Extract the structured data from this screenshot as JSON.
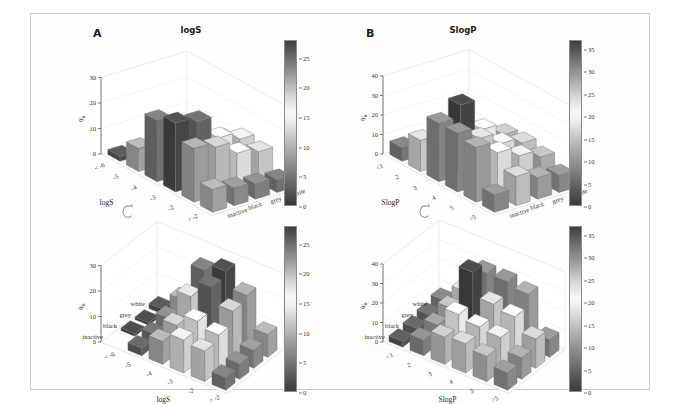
{
  "figure": {
    "background": "#ffffff",
    "frame_color": "#c9c9c9",
    "rotate_icon": "rotation-arrow-icon"
  },
  "panels": [
    {
      "id": "A-top",
      "letter": "A",
      "title": "logS",
      "view": "front",
      "ylabel": "%",
      "xname": "logS",
      "xticks": [
        "< -6",
        "-5",
        "-4",
        "-3",
        "-2",
        "> -2"
      ],
      "yticks": [
        "white",
        "grey",
        "black",
        "inactive"
      ],
      "zticks": [
        "0",
        "10",
        "20",
        "30"
      ]
    },
    {
      "id": "B-top",
      "letter": "B",
      "title": "SlogP",
      "view": "front",
      "ylabel": "%",
      "xname": "SlogP",
      "xticks": [
        "<1",
        "2",
        "3",
        "4",
        "5",
        ">5"
      ],
      "yticks": [
        "white",
        "grey",
        "black",
        "inactive"
      ],
      "zticks": [
        "0",
        "10",
        "20",
        "30",
        "40"
      ]
    },
    {
      "id": "A-bottom",
      "letter": "",
      "title": "",
      "view": "rotated",
      "ylabel": "%",
      "xname": "logS",
      "xticks": [
        "< -6",
        "-5",
        "-4",
        "-3",
        "-2",
        "> -2"
      ],
      "yticks": [
        "white",
        "grey",
        "black",
        "inactive"
      ],
      "zticks": [
        "0",
        "10",
        "20",
        "30"
      ]
    },
    {
      "id": "B-bottom",
      "letter": "",
      "title": "",
      "view": "rotated",
      "ylabel": "%",
      "xname": "SlogP",
      "xticks": [
        "<1",
        "2",
        "3",
        "4",
        "5",
        ">5"
      ],
      "yticks": [
        "white",
        "grey",
        "black",
        "inactive"
      ],
      "zticks": [
        "0",
        "10",
        "20",
        "30",
        "40"
      ]
    }
  ],
  "colorbars": [
    {
      "id": "cb-A-top",
      "ticks": [
        "0",
        "5",
        "10",
        "15",
        "20",
        "25"
      ],
      "min": 0,
      "max": 28
    },
    {
      "id": "cb-B-top",
      "ticks": [
        "0",
        "5",
        "10",
        "15",
        "20",
        "25",
        "30",
        "35"
      ],
      "min": 0,
      "max": 37
    },
    {
      "id": "cb-A-bottom",
      "ticks": [
        "0",
        "5",
        "10",
        "15",
        "20",
        "25"
      ],
      "min": 0,
      "max": 28
    },
    {
      "id": "cb-B-bottom",
      "ticks": [
        "0",
        "5",
        "10",
        "15",
        "20",
        "25",
        "30",
        "35"
      ],
      "min": 0,
      "max": 37
    }
  ],
  "chart_data": [
    {
      "type": "bar3d",
      "id": "A-top",
      "title": "logS",
      "xlabel": "logS",
      "ylabel": "",
      "zlabel": "%",
      "zlim": [
        0,
        30
      ],
      "colorbar_range": [
        0,
        28
      ],
      "grid": true,
      "categories_x": [
        "< -6",
        "-5",
        "-4",
        "-3",
        "-2",
        "> -2"
      ],
      "categories_y": [
        "inactive",
        "black",
        "grey",
        "white"
      ],
      "series": [
        {
          "name": "inactive",
          "values": [
            2,
            9,
            24,
            27,
            21,
            9
          ]
        },
        {
          "name": "black",
          "values": [
            1,
            6,
            18,
            25,
            19,
            7
          ]
        },
        {
          "name": "grey",
          "values": [
            1,
            4,
            11,
            16,
            14,
            6
          ]
        },
        {
          "name": "white",
          "values": [
            0,
            3,
            9,
            13,
            12,
            5
          ]
        }
      ]
    },
    {
      "type": "bar3d",
      "id": "B-top",
      "title": "SlogP",
      "xlabel": "SlogP",
      "ylabel": "",
      "zlabel": "%",
      "zlim": [
        0,
        40
      ],
      "colorbar_range": [
        0,
        37
      ],
      "grid": true,
      "categories_x": [
        "<1",
        "2",
        "3",
        "4",
        "5",
        ">5"
      ],
      "categories_y": [
        "inactive",
        "black",
        "grey",
        "white"
      ],
      "series": [
        {
          "name": "inactive",
          "values": [
            7,
            16,
            30,
            30,
            28,
            9
          ]
        },
        {
          "name": "black",
          "values": [
            5,
            13,
            36,
            24,
            22,
            15
          ]
        },
        {
          "name": "grey",
          "values": [
            4,
            10,
            20,
            18,
            17,
            11
          ]
        },
        {
          "name": "white",
          "values": [
            3,
            8,
            14,
            15,
            13,
            9
          ]
        }
      ]
    },
    {
      "type": "bar3d",
      "id": "A-bottom",
      "title": "",
      "xlabel": "logS",
      "ylabel": "",
      "zlabel": "%",
      "zlim": [
        0,
        30
      ],
      "colorbar_range": [
        0,
        28
      ],
      "grid": true,
      "categories_x": [
        "< -6",
        "-5",
        "-4",
        "-3",
        "-2",
        "> -2"
      ],
      "categories_y": [
        "white",
        "grey",
        "black",
        "inactive"
      ],
      "series": [
        {
          "name": "white",
          "values": [
            0,
            3,
            9,
            13,
            12,
            5
          ]
        },
        {
          "name": "grey",
          "values": [
            1,
            4,
            11,
            16,
            14,
            6
          ]
        },
        {
          "name": "black",
          "values": [
            1,
            6,
            18,
            25,
            19,
            7
          ]
        },
        {
          "name": "inactive",
          "values": [
            2,
            9,
            24,
            27,
            21,
            9
          ]
        }
      ]
    },
    {
      "type": "bar3d",
      "id": "B-bottom",
      "title": "",
      "xlabel": "SlogP",
      "ylabel": "",
      "zlabel": "%",
      "zlim": [
        0,
        40
      ],
      "colorbar_range": [
        0,
        37
      ],
      "grid": true,
      "categories_x": [
        "<1",
        "2",
        "3",
        "4",
        "5",
        ">5"
      ],
      "categories_y": [
        "white",
        "grey",
        "black",
        "inactive"
      ],
      "series": [
        {
          "name": "white",
          "values": [
            3,
            8,
            14,
            15,
            13,
            9
          ]
        },
        {
          "name": "grey",
          "values": [
            4,
            10,
            20,
            18,
            17,
            11
          ]
        },
        {
          "name": "black",
          "values": [
            5,
            13,
            36,
            24,
            22,
            15
          ]
        },
        {
          "name": "inactive",
          "values": [
            7,
            16,
            30,
            30,
            28,
            9
          ]
        }
      ]
    }
  ]
}
